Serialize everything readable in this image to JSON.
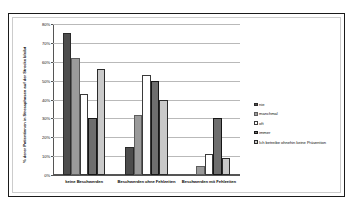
{
  "chart_data": {
    "type": "bar",
    "title": "",
    "xlabel": "",
    "ylabel": "% derer Patientinnen in Stressphasen auf der Strecke bleibt",
    "ylim": [
      0,
      80
    ],
    "yticks": [
      "0%",
      "10%",
      "20%",
      "30%",
      "40%",
      "50%",
      "60%",
      "70%",
      "80%"
    ],
    "grid": true,
    "legend_position": "right",
    "categories": [
      "keine Beschwerden",
      "Beschwerden ohne Fehlzeiten",
      "Beschwerden mit Fehlzeiten"
    ],
    "series": [
      {
        "name": "nie",
        "color": "#4d4d4d",
        "values": [
          75,
          15,
          0
        ]
      },
      {
        "name": "manchmal",
        "color": "#9a9a9a",
        "values": [
          62,
          32,
          5
        ]
      },
      {
        "name": "oft",
        "color": "#ffffff",
        "values": [
          43,
          53,
          11
        ]
      },
      {
        "name": "immer",
        "color": "#6e6e6e",
        "values": [
          30,
          50,
          30
        ]
      },
      {
        "name": "Ich betreibe ohnehin keine Prävention",
        "color": "#c9c9c9",
        "values": [
          56,
          40,
          9
        ]
      }
    ]
  },
  "axis": {
    "y_title": "% derer Patientinnen in Stressphasen auf der Strecke bleibt",
    "ticks": [
      "80%",
      "70%",
      "60%",
      "50%",
      "40%",
      "30%",
      "20%",
      "10%",
      "0%"
    ]
  },
  "categories": [
    "keine Beschwerden",
    "Beschwerden ohne Fehlzeiten",
    "Beschwerden mit Fehlzeiten"
  ],
  "legend": {
    "items": [
      {
        "label": "nie"
      },
      {
        "label": "manchmal"
      },
      {
        "label": "oft"
      },
      {
        "label": "immer"
      },
      {
        "label": "Ich betreibe ohnehin keine Prävention"
      }
    ]
  }
}
